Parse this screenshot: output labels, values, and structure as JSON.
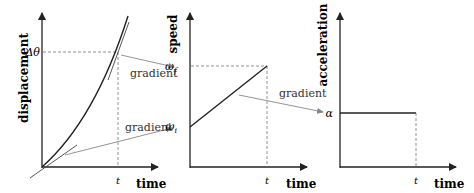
{
  "panels": [
    {
      "y_label": "displacement",
      "x_label": "time",
      "y_tick": "Δθ",
      "x_tick": "t"
    },
    {
      "y_label": "speed",
      "x_label": "time",
      "y_tick_top": "ω",
      "y_tick_top_sub": "f",
      "y_tick_bottom": "ω",
      "y_tick_bottom_sub": "i",
      "x_tick": "t"
    },
    {
      "y_label": "acceleration",
      "x_label": "time",
      "y_tick": "α",
      "x_tick": "t"
    }
  ],
  "annotations": {
    "gradient_1": "gradient",
    "gradient_2": "gradient",
    "gradient_3": "gradient"
  },
  "colors": {
    "axis": "#222222",
    "arrow": "#888888",
    "dashed": "#777777"
  }
}
